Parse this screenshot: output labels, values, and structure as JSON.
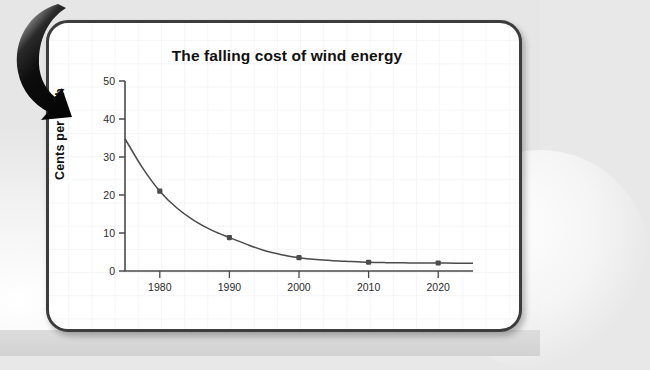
{
  "slide": {
    "card_label": "chart-slide"
  },
  "annotation": {
    "arrow_icon_name": "curved-down-left-arrow-icon",
    "arrow_color": "#111111"
  },
  "chart_data": {
    "type": "line",
    "title": "The falling cost of wind energy",
    "xlabel": "Year",
    "ylabel": "Cents per KWh",
    "xlim": [
      1975,
      2025
    ],
    "ylim": [
      0,
      50
    ],
    "grid": true,
    "legend": "none",
    "x_ticks": [
      "1980",
      "1990",
      "2000",
      "2010",
      "2020"
    ],
    "x_tick_values": [
      1980,
      1990,
      2000,
      2010,
      2020
    ],
    "y_ticks": [
      "0",
      "10",
      "20",
      "30",
      "40",
      "50"
    ],
    "y_tick_values": [
      0,
      10,
      20,
      30,
      40,
      50
    ],
    "marker_years": [
      1980,
      1990,
      2000,
      2010,
      2020
    ],
    "marker_values": [
      21,
      8.8,
      3.5,
      2.3,
      2.1
    ],
    "curve_x": [
      1975,
      1977.5,
      1980,
      1982.5,
      1985,
      1987.5,
      1990,
      1992.5,
      1995,
      1997.5,
      2000,
      2002.5,
      2005,
      2007.5,
      2010,
      2012.5,
      2015,
      2017.5,
      2020,
      2022.5,
      2025
    ],
    "curve_y": [
      34.8,
      27.2,
      21.0,
      16.5,
      13.2,
      10.7,
      8.8,
      7.0,
      5.4,
      4.3,
      3.5,
      3.0,
      2.7,
      2.5,
      2.3,
      2.2,
      2.15,
      2.1,
      2.1,
      2.05,
      2.05
    ]
  }
}
